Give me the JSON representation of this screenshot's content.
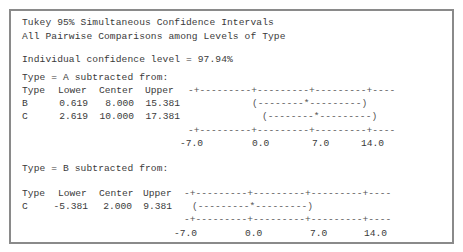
{
  "title_line1": "Tukey 95% Simultaneous Confidence Intervals",
  "title_line2": "All Pairwise Comparisons among Levels of Type",
  "individual_confidence": "Individual confidence level = 97.94%",
  "section_a": {
    "heading": "Type = A subtracted from:",
    "columns": [
      "Type",
      "Lower",
      "Center",
      "Upper"
    ],
    "top_axis": "-+---------+---------+---------+----",
    "rows": [
      {
        "type": "B",
        "lower": "0.619",
        "center": "8.000",
        "upper": "15.381",
        "interval": "(--------*---------)"
      },
      {
        "type": "C",
        "lower": "2.619",
        "center": "10.000",
        "upper": "17.381",
        "interval": "(--------*---------)"
      }
    ],
    "bottom_axis": "-+---------+---------+---------+----",
    "ticks": [
      "-7.0",
      "0.0",
      "7.0",
      "14.0"
    ]
  },
  "section_b": {
    "heading": "Type = B subtracted from:",
    "columns": [
      "Type",
      "Lower",
      "Center",
      "Upper"
    ],
    "top_axis": "-+---------+---------+---------+----",
    "rows": [
      {
        "type": "C",
        "lower": "-5.381",
        "center": "2.000",
        "upper": "9.381",
        "interval": "(---------*---------)"
      }
    ],
    "bottom_axis": "-+---------+---------+---------+----",
    "ticks": [
      "-7.0",
      "0.0",
      "7.0",
      "14.0"
    ]
  }
}
